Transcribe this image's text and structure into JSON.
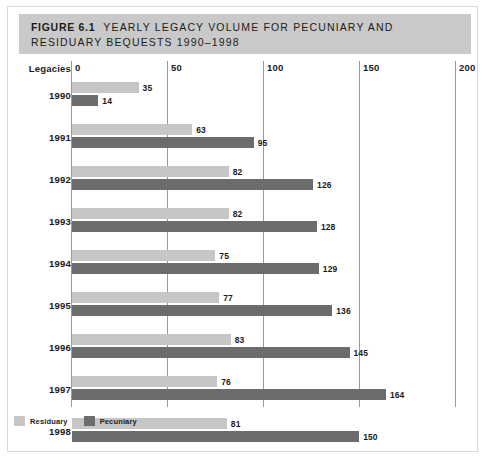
{
  "figure": {
    "label": "FIGURE",
    "number": "6.1",
    "title_line1": "YEARLY LEGACY VOLUME FOR PECUNIARY AND",
    "title_line2": "RESIDUARY BEQUESTS 1990–1998"
  },
  "axis": {
    "y_axis_title": "Legacies",
    "x_ticks": [
      "0",
      "50",
      "100",
      "150",
      "200"
    ]
  },
  "legend": {
    "items": [
      {
        "label": "Residuary",
        "color": "#c6c6c6"
      },
      {
        "label": "Pecuniary",
        "color": "#6c6c6c"
      }
    ]
  },
  "colors": {
    "header_band": "#c9c9c9",
    "residuary": "#c6c6c6",
    "pecuniary": "#6c6c6c",
    "gridline": "#9a9a9a",
    "text": "#1b1b1b",
    "frame": "#d9d9d9"
  },
  "chart_data": {
    "type": "bar",
    "orientation": "horizontal",
    "xlabel": "",
    "ylabel": "Legacies",
    "xlim": [
      0,
      200
    ],
    "xticks": [
      0,
      50,
      100,
      150,
      200
    ],
    "grid": true,
    "legend_position": "bottom-left",
    "categories": [
      "1990",
      "1991",
      "1992",
      "1993",
      "1994",
      "1995",
      "1996",
      "1997",
      "1998"
    ],
    "series": [
      {
        "name": "Residuary",
        "color": "#c6c6c6",
        "values": [
          35,
          63,
          82,
          82,
          75,
          77,
          83,
          76,
          81
        ]
      },
      {
        "name": "Pecuniary",
        "color": "#6c6c6c",
        "values": [
          14,
          95,
          126,
          128,
          129,
          136,
          145,
          164,
          150
        ]
      }
    ]
  }
}
